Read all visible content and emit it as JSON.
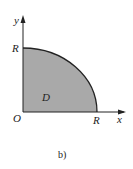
{
  "figure": {
    "caption": "b)",
    "region_label": "D",
    "origin_label": "O",
    "x_axis_label": "x",
    "y_axis_label": "y",
    "x_intercept_label": "R",
    "y_intercept_label": "R",
    "region_fill": "#a9a9a9",
    "stroke_color": "#222222"
  }
}
